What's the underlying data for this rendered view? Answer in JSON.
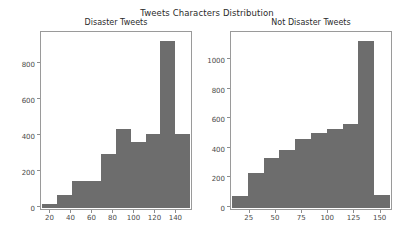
{
  "figure": {
    "suptitle": "Tweets Characters Distribution",
    "background": "#ffffff",
    "bar_color": "#6d6d6d",
    "axis_color": "#9a9a9a"
  },
  "chart_data": [
    {
      "type": "bar",
      "title": "Disaster Tweets",
      "xlabel": "",
      "ylabel": "",
      "grid": false,
      "legend": null,
      "xlim": [
        11,
        152
      ],
      "ylim": [
        0,
        975
      ],
      "xticks": [
        20,
        40,
        60,
        80,
        100,
        120,
        140
      ],
      "yticks": [
        0,
        200,
        400,
        600,
        800
      ],
      "bin_edges": [
        11,
        25.1,
        39.2,
        53.3,
        67.4,
        81.5,
        95.6,
        109.7,
        123.8,
        137.9,
        152
      ],
      "categories": [
        "11-25",
        "25-39",
        "39-53",
        "53-67",
        "67-82",
        "82-96",
        "96-110",
        "110-124",
        "124-138",
        "138-152"
      ],
      "values": [
        25,
        75,
        150,
        150,
        300,
        440,
        370,
        410,
        930,
        415
      ]
    },
    {
      "type": "bar",
      "title": "Not Disaster Tweets",
      "xlabel": "",
      "ylabel": "",
      "grid": false,
      "legend": null,
      "xlim": [
        7,
        158
      ],
      "ylim": [
        0,
        1185
      ],
      "xticks": [
        0,
        25,
        50,
        75,
        100,
        125,
        150
      ],
      "yticks": [
        0,
        200,
        400,
        600,
        800,
        1000
      ],
      "bin_edges": [
        7,
        22.1,
        37.2,
        52.3,
        67.4,
        82.5,
        97.6,
        112.7,
        127.8,
        142.9,
        158
      ],
      "categories": [
        "7-22",
        "22-37",
        "37-52",
        "52-67",
        "67-83",
        "83-98",
        "98-113",
        "113-128",
        "128-143",
        "143-158"
      ],
      "values": [
        80,
        240,
        340,
        390,
        470,
        505,
        535,
        570,
        1130,
        85
      ]
    }
  ]
}
